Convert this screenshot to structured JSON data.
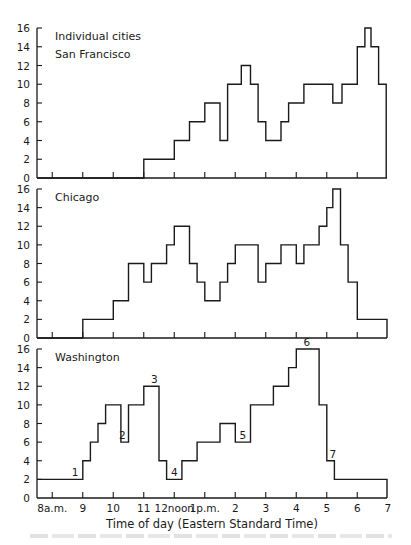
{
  "figure": {
    "type": "step-histogram (three stacked panels)",
    "xlabel": "Time of day (Eastern Standard Time)",
    "x_tick_labels": [
      "8a.m.",
      "9",
      "10",
      "11",
      "12noon",
      "1p.m.",
      "2",
      "3",
      "4",
      "5",
      "6",
      "7"
    ],
    "y_tick_labels": [
      "0",
      "2",
      "4",
      "6",
      "8",
      "10",
      "12",
      "14",
      "16"
    ]
  },
  "chart_data": [
    {
      "type": "line",
      "subtype": "step",
      "title": "Individual cities",
      "panel_label": "San Francisco",
      "xlabel": "Time of day (Eastern Standard Time)",
      "ylabel": "",
      "ylim": [
        0,
        16
      ],
      "xlim": [
        7.5,
        19.0
      ],
      "x_unit": "hour of day (24h, EST)",
      "steps": [
        {
          "start": 7.5,
          "value": 0
        },
        {
          "start": 11.0,
          "value": 2
        },
        {
          "start": 12.0,
          "value": 4
        },
        {
          "start": 12.5,
          "value": 6
        },
        {
          "start": 13.0,
          "value": 8
        },
        {
          "start": 13.5,
          "value": 4
        },
        {
          "start": 13.75,
          "value": 10
        },
        {
          "start": 14.2,
          "value": 12
        },
        {
          "start": 14.5,
          "value": 10
        },
        {
          "start": 14.75,
          "value": 6
        },
        {
          "start": 15.0,
          "value": 4
        },
        {
          "start": 15.5,
          "value": 6
        },
        {
          "start": 15.75,
          "value": 8
        },
        {
          "start": 16.25,
          "value": 10
        },
        {
          "start": 17.2,
          "value": 8
        },
        {
          "start": 17.5,
          "value": 10
        },
        {
          "start": 18.0,
          "value": 14
        },
        {
          "start": 18.25,
          "value": 16
        },
        {
          "start": 18.45,
          "value": 14
        },
        {
          "start": 18.7,
          "value": 10
        }
      ],
      "end": 18.95,
      "grid": false
    },
    {
      "type": "line",
      "subtype": "step",
      "panel_label": "Chicago",
      "xlabel": "Time of day (Eastern Standard Time)",
      "ylim": [
        0,
        16
      ],
      "xlim": [
        7.5,
        19.0
      ],
      "steps": [
        {
          "start": 7.5,
          "value": 0
        },
        {
          "start": 9.0,
          "value": 2
        },
        {
          "start": 10.0,
          "value": 4
        },
        {
          "start": 10.5,
          "value": 8
        },
        {
          "start": 11.0,
          "value": 6
        },
        {
          "start": 11.25,
          "value": 8
        },
        {
          "start": 11.75,
          "value": 10
        },
        {
          "start": 12.0,
          "value": 12
        },
        {
          "start": 12.5,
          "value": 8
        },
        {
          "start": 12.75,
          "value": 6
        },
        {
          "start": 13.0,
          "value": 4
        },
        {
          "start": 13.5,
          "value": 6
        },
        {
          "start": 13.75,
          "value": 8
        },
        {
          "start": 14.0,
          "value": 10
        },
        {
          "start": 14.75,
          "value": 6
        },
        {
          "start": 15.0,
          "value": 8
        },
        {
          "start": 15.5,
          "value": 10
        },
        {
          "start": 16.0,
          "value": 8
        },
        {
          "start": 16.25,
          "value": 10
        },
        {
          "start": 16.75,
          "value": 12
        },
        {
          "start": 17.0,
          "value": 14
        },
        {
          "start": 17.2,
          "value": 16
        },
        {
          "start": 17.45,
          "value": 10
        },
        {
          "start": 17.7,
          "value": 6
        },
        {
          "start": 18.0,
          "value": 2
        }
      ],
      "end": 19.0,
      "grid": false
    },
    {
      "type": "line",
      "subtype": "step",
      "panel_label": "Washington",
      "xlabel": "Time of day (Eastern Standard Time)",
      "ylim": [
        0,
        16
      ],
      "xlim": [
        7.5,
        19.0
      ],
      "steps": [
        {
          "start": 7.5,
          "value": 2
        },
        {
          "start": 9.0,
          "value": 4
        },
        {
          "start": 9.25,
          "value": 6
        },
        {
          "start": 9.5,
          "value": 8
        },
        {
          "start": 9.75,
          "value": 10
        },
        {
          "start": 10.25,
          "value": 6
        },
        {
          "start": 10.5,
          "value": 10
        },
        {
          "start": 11.0,
          "value": 12
        },
        {
          "start": 11.5,
          "value": 4
        },
        {
          "start": 11.75,
          "value": 2
        },
        {
          "start": 12.25,
          "value": 4
        },
        {
          "start": 12.75,
          "value": 6
        },
        {
          "start": 13.5,
          "value": 8
        },
        {
          "start": 14.0,
          "value": 6
        },
        {
          "start": 14.5,
          "value": 10
        },
        {
          "start": 15.25,
          "value": 12
        },
        {
          "start": 15.75,
          "value": 14
        },
        {
          "start": 16.0,
          "value": 16
        },
        {
          "start": 16.75,
          "value": 10
        },
        {
          "start": 17.0,
          "value": 4
        },
        {
          "start": 17.25,
          "value": 2
        }
      ],
      "end": 19.0,
      "annotations": [
        {
          "label": "1",
          "x": 8.75,
          "y": 2
        },
        {
          "label": "2",
          "x": 10.3,
          "y": 6
        },
        {
          "label": "3",
          "x": 11.35,
          "y": 12
        },
        {
          "label": "4",
          "x": 12.0,
          "y": 2
        },
        {
          "label": "5",
          "x": 14.25,
          "y": 6
        },
        {
          "label": "6",
          "x": 16.35,
          "y": 16
        },
        {
          "label": "7",
          "x": 17.2,
          "y": 4
        }
      ],
      "grid": false
    }
  ],
  "panels": {
    "p0": {
      "title": "Individual cities",
      "label": "San Francisco"
    },
    "p1": {
      "label": "Chicago"
    },
    "p2": {
      "label": "Washington"
    }
  }
}
